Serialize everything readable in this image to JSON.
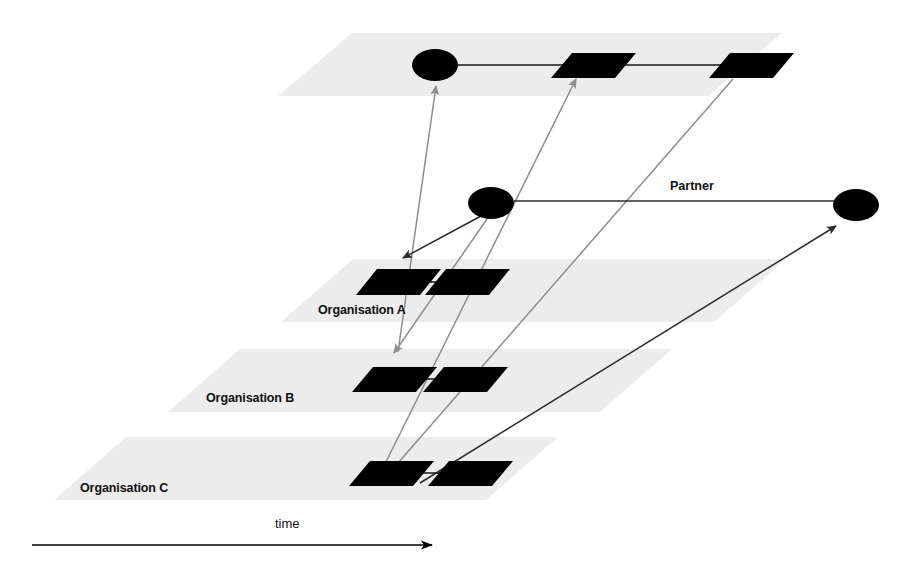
{
  "diagram": {
    "title_visible": false,
    "background_color": "#ffffff",
    "plane_color": "#ececed",
    "node_color": "#000000",
    "dark_edge_color": "#2b2b2b",
    "gray_edge_color": "#8d8d8d",
    "axis": {
      "label": "time",
      "label_x": 275,
      "label_y": 528,
      "line_x1": 32,
      "line_y1": 545,
      "line_x2": 432,
      "line_y2": 545,
      "direction": "left-to-right"
    },
    "planes": [
      {
        "id": "plane-top",
        "label": "",
        "label_x": 0,
        "label_y": 0,
        "points": "278,96 352,33 782,33 708,96"
      },
      {
        "id": "plane-organisation-a",
        "label": "Organisation A",
        "label_x": 318,
        "label_y": 314,
        "points": "281,322 353,259 786,259 714,322"
      },
      {
        "id": "plane-organisation-b",
        "label": "Organisation B",
        "label_x": 206,
        "label_y": 402,
        "points": "168,412 240,349 672,349 600,412"
      },
      {
        "id": "plane-organisation-c",
        "label": "Organisation C",
        "label_x": 80,
        "label_y": 492,
        "points": "54,500 126,437 558,437 486,500"
      }
    ],
    "nodes": [
      {
        "id": "node-top-ellipse",
        "type": "ellipse",
        "cx": 435,
        "cy": 65,
        "rx": 23,
        "ry": 16,
        "plane": "plane-top"
      },
      {
        "id": "node-top-activity-1",
        "type": "parallelogram",
        "points": "551,78 572,53 636,53 615,78",
        "plane": "plane-top"
      },
      {
        "id": "node-top-activity-2",
        "type": "parallelogram",
        "points": "709,78 730,53 794,53 773,78",
        "plane": "plane-top"
      },
      {
        "id": "node-center-ellipse",
        "type": "ellipse",
        "cx": 491,
        "cy": 203,
        "rx": 23,
        "ry": 16,
        "plane": "none"
      },
      {
        "id": "node-partner-ellipse",
        "type": "ellipse",
        "cx": 856,
        "cy": 205,
        "rx": 23,
        "ry": 16,
        "plane": "none"
      },
      {
        "id": "node-orga-activity-1",
        "type": "parallelogram",
        "points": "356,295 377,269 441,269 420,295",
        "plane": "plane-organisation-a"
      },
      {
        "id": "node-orga-activity-2",
        "type": "parallelogram",
        "points": "425,295 446,269 510,269 489,295",
        "plane": "plane-organisation-a"
      },
      {
        "id": "node-orgb-activity-1",
        "type": "parallelogram",
        "points": "352,392 373,367 437,367 416,392",
        "plane": "plane-organisation-b"
      },
      {
        "id": "node-orgb-activity-2",
        "type": "parallelogram",
        "points": "423,392 444,367 508,367 487,392",
        "plane": "plane-organisation-b"
      },
      {
        "id": "node-orgc-activity-1",
        "type": "parallelogram",
        "points": "349,486 370,461 434,461 413,486",
        "plane": "plane-organisation-c"
      },
      {
        "id": "node-orgc-activity-2",
        "type": "parallelogram",
        "points": "428,486 449,461 513,461 492,486",
        "plane": "plane-organisation-c"
      }
    ],
    "intra_plane_links": [
      {
        "id": "link-top-1",
        "x1": 458,
        "y1": 65,
        "x2": 572,
        "y2": 65
      },
      {
        "id": "link-top-2",
        "x1": 615,
        "y1": 65,
        "x2": 732,
        "y2": 65
      },
      {
        "id": "link-orga-1",
        "x1": 399,
        "y1": 282,
        "x2": 448,
        "y2": 282
      },
      {
        "id": "link-orgb-1",
        "x1": 396,
        "y1": 379,
        "x2": 446,
        "y2": 379
      },
      {
        "id": "link-orgc-1",
        "x1": 392,
        "y1": 473,
        "x2": 451,
        "y2": 473
      }
    ],
    "relations": [
      {
        "id": "relation-orgb-to-top-ellipse",
        "style": "gray",
        "x1": 398,
        "y1": 352,
        "x2": 436,
        "y2": 86,
        "arrow": "end",
        "label": ""
      },
      {
        "id": "relation-center-to-orga",
        "style": "dark",
        "x1": 481,
        "y1": 216,
        "x2": 403,
        "y2": 258,
        "arrow": "end",
        "label": ""
      },
      {
        "id": "relation-center-to-orgb",
        "style": "gray",
        "x1": 487,
        "y1": 219,
        "x2": 394,
        "y2": 353,
        "arrow": "end",
        "label": ""
      },
      {
        "id": "relation-orgc-to-top-activity-1",
        "style": "gray",
        "x1": 382,
        "y1": 470,
        "x2": 576,
        "y2": 79,
        "arrow": "end",
        "label": ""
      },
      {
        "id": "relation-orgc-to-top-activity-2",
        "style": "gray",
        "x1": 391,
        "y1": 471,
        "x2": 733,
        "y2": 79,
        "arrow": "none",
        "label": ""
      },
      {
        "id": "relation-orgc-to-partner",
        "style": "dark",
        "x1": 420,
        "y1": 483,
        "x2": 836,
        "y2": 226,
        "arrow": "end",
        "label": ""
      },
      {
        "id": "relation-center-to-partner",
        "style": "dark",
        "x1": 514,
        "y1": 201,
        "x2": 834,
        "y2": 201,
        "arrow": "none",
        "label": "Partner",
        "label_x": 670,
        "label_y": 190
      }
    ]
  }
}
